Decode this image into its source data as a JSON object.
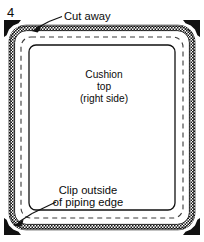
{
  "figure": {
    "step_number": "4",
    "callouts": [
      {
        "id": "cut-away",
        "text": "Cut away"
      },
      {
        "id": "clip-outside",
        "line1": "Clip outside",
        "line2": "of piping edge"
      }
    ],
    "center_label": {
      "line1": "Cushion",
      "line2": "top",
      "line3": "(right side)"
    },
    "layers": [
      {
        "name": "outer-cut-line",
        "style": "solid-thin"
      },
      {
        "name": "piping-band",
        "style": "stippled-hatch"
      },
      {
        "name": "seam-line",
        "style": "dashed"
      },
      {
        "name": "cushion-top-edge",
        "style": "solid"
      }
    ],
    "corner_markers": {
      "name": "corner-notch-wedge",
      "count": 4,
      "positions": [
        "top-left",
        "top-right",
        "bottom-left",
        "bottom-right"
      ]
    },
    "colors": {
      "ink": "#111111",
      "paper": "#ffffff",
      "hatch": "#1a1a1a"
    }
  }
}
